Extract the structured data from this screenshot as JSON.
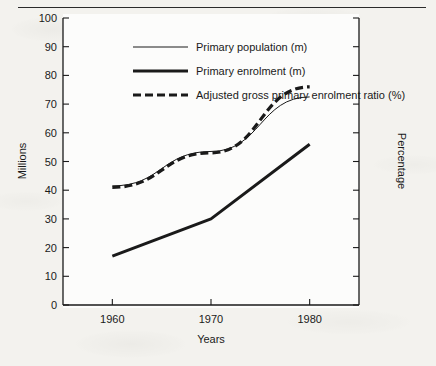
{
  "chart_data": {
    "type": "line",
    "title": "",
    "xlabel": "Years",
    "ylabel": "Millions",
    "y2label": "Percentage",
    "x": [
      1960,
      1970,
      1980
    ],
    "xlim": [
      1955,
      1985
    ],
    "ylim": [
      0,
      100
    ],
    "y2lim": [
      0,
      100
    ],
    "yticks": [
      0,
      10,
      20,
      30,
      40,
      50,
      60,
      70,
      80,
      90,
      100
    ],
    "ytick_labels": [
      "0",
      "10",
      "20",
      "30",
      "40",
      "50",
      "60",
      "70",
      "80",
      "90",
      "100"
    ],
    "y2ticks": [
      0,
      10,
      20,
      30,
      40,
      50,
      60,
      70,
      80,
      90,
      100
    ],
    "y2tick_labels": [
      "",
      "",
      "",
      "",
      "",
      "",
      "",
      "",
      "",
      "",
      ""
    ],
    "xticks": [
      1960,
      1970,
      1980
    ],
    "xtick_labels": [
      "1960",
      "1970",
      "1980"
    ],
    "grid": false,
    "legend_position": "upper-center",
    "series": [
      {
        "name": "Primary population (m)",
        "style": "thin-solid",
        "axis": "left",
        "color": "#1a1a1a",
        "values": [
          41.5,
          53.5,
          72.5
        ]
      },
      {
        "name": "Primary enrolment (m)",
        "style": "thick-solid",
        "axis": "left",
        "color": "#1a1a1a",
        "values": [
          17,
          30,
          56
        ]
      },
      {
        "name": "Adjusted gross primary enrolment ratio (%)",
        "style": "thick-dashed",
        "axis": "right",
        "color": "#1a1a1a",
        "values": [
          41,
          53,
          76
        ]
      }
    ]
  },
  "legend": {
    "items": [
      {
        "label": "Primary population (m)"
      },
      {
        "label": "Primary enrolment (m)"
      },
      {
        "label": "Adjusted gross primary enrolment ratio (%)"
      }
    ]
  },
  "axes": {
    "left_title": "Millions",
    "right_title": "Percentage",
    "bottom_title": "Years"
  }
}
